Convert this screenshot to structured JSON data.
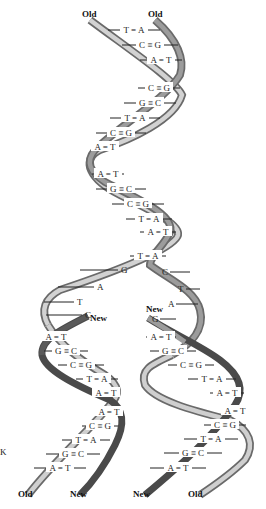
{
  "colors": {
    "old_strand_light": "#c8c8c8",
    "old_strand_edge": "#6a6a6a",
    "new_strand": "#4a4a4a",
    "backbone_dark": "#7a7a7a",
    "text": "#111111"
  },
  "labels": {
    "top_left": "Old",
    "top_right": "Old",
    "fork_new_left": "New",
    "fork_new_right": "New",
    "bottom_left_old": "Old",
    "bottom_left_new": "New",
    "bottom_right_new": "New",
    "bottom_right_old": "Old",
    "side_mark": "K"
  },
  "parent_pairs": [
    {
      "l": "T",
      "r": "A",
      "bond": "double"
    },
    {
      "l": "C",
      "r": "G",
      "bond": "triple"
    },
    {
      "l": "A",
      "r": "T",
      "bond": "double"
    },
    {
      "l": "C",
      "r": "G",
      "bond": "triple"
    },
    {
      "l": "G",
      "r": "C",
      "bond": "triple"
    },
    {
      "l": "T",
      "r": "A",
      "bond": "double"
    },
    {
      "l": "C",
      "r": "G",
      "bond": "triple"
    },
    {
      "l": "A",
      "r": "T",
      "bond": "double"
    },
    {
      "l": "A",
      "r": "T",
      "bond": "double"
    },
    {
      "l": "G",
      "r": "C",
      "bond": "triple"
    },
    {
      "l": "C",
      "r": "G",
      "bond": "triple"
    },
    {
      "l": "T",
      "r": "A",
      "bond": "double"
    },
    {
      "l": "A",
      "r": "T",
      "bond": "double"
    },
    {
      "l": "T",
      "r": "A",
      "bond": "double"
    }
  ],
  "unpaired": {
    "left": [
      "G",
      "A",
      "T",
      "C"
    ],
    "right": [
      "C",
      "T",
      "A",
      "G"
    ]
  },
  "daughter_left_pairs": [
    {
      "l": "A",
      "r": "T",
      "bond": "double"
    },
    {
      "l": "G",
      "r": "C",
      "bond": "triple"
    },
    {
      "l": "C",
      "r": "G",
      "bond": "triple"
    },
    {
      "l": "T",
      "r": "A",
      "bond": "double"
    },
    {
      "l": "A",
      "r": "T",
      "bond": "double"
    },
    {
      "l": "A",
      "r": "T",
      "bond": "double"
    },
    {
      "l": "C",
      "r": "G",
      "bond": "triple"
    },
    {
      "l": "T",
      "r": "A",
      "bond": "double"
    },
    {
      "l": "G",
      "r": "C",
      "bond": "triple"
    },
    {
      "l": "A",
      "r": "T",
      "bond": "double"
    }
  ],
  "daughter_right_pairs": [
    {
      "l": "A",
      "r": "T",
      "bond": "double"
    },
    {
      "l": "G",
      "r": "C",
      "bond": "triple"
    },
    {
      "l": "C",
      "r": "G",
      "bond": "triple"
    },
    {
      "l": "T",
      "r": "A",
      "bond": "double"
    },
    {
      "l": "A",
      "r": "T",
      "bond": "double"
    },
    {
      "l": "A",
      "r": "T",
      "bond": "double"
    },
    {
      "l": "C",
      "r": "G",
      "bond": "triple"
    },
    {
      "l": "T",
      "r": "A",
      "bond": "double"
    },
    {
      "l": "G",
      "r": "C",
      "bond": "triple"
    },
    {
      "l": "A",
      "r": "T",
      "bond": "double"
    }
  ],
  "bond_glyphs": {
    "double": "=",
    "triple": "≡"
  }
}
